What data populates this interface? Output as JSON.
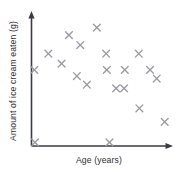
{
  "chart_data": {
    "type": "scatter",
    "title": "",
    "xlabel": "Age (years)",
    "ylabel": "Amount of ice cream eaten (g)",
    "grid": false,
    "legend": null,
    "x_tick_labels": [],
    "y_tick_labels": [],
    "xlim": [
      0,
      100
    ],
    "ylim": [
      0,
      100
    ],
    "marker": "x",
    "marker_color": "#9a9aa2",
    "axis_color": "#3b3b40",
    "background_color": "#ffffff",
    "correlation": "negative",
    "point_count": 20,
    "points": [
      {
        "x": 1.0,
        "y": 59.0
      },
      {
        "x": 11.5,
        "y": 72.0
      },
      {
        "x": 21.5,
        "y": 64.0
      },
      {
        "x": 27.0,
        "y": 87.0
      },
      {
        "x": 35.5,
        "y": 79.0
      },
      {
        "x": 33.0,
        "y": 54.0
      },
      {
        "x": 48.0,
        "y": 93.0
      },
      {
        "x": 40.5,
        "y": 47.0
      },
      {
        "x": 55.0,
        "y": 72.0
      },
      {
        "x": 55.5,
        "y": 59.0
      },
      {
        "x": 62.5,
        "y": 44.0
      },
      {
        "x": 68.5,
        "y": 44.0
      },
      {
        "x": 69.0,
        "y": 59.0
      },
      {
        "x": 79.5,
        "y": 72.0
      },
      {
        "x": 88.0,
        "y": 59.0
      },
      {
        "x": 93.0,
        "y": 52.0
      },
      {
        "x": 80.0,
        "y": 28.0
      },
      {
        "x": 99.0,
        "y": 17.0
      },
      {
        "x": 57.5,
        "y": 0.5
      },
      {
        "x": 1.5,
        "y": 0.5
      }
    ]
  },
  "axes": {
    "x_axis_name": "x-axis",
    "y_axis_name": "y-axis",
    "x_label_text": "Age (years)",
    "y_label_text": "Amount of ice cream eaten (g)"
  }
}
